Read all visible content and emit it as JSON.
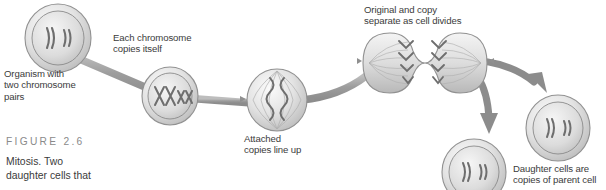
{
  "figure": {
    "label": "FIGURE 2.6",
    "caption_line1": "Mitosis. Two",
    "caption_line2": "daughter cells that",
    "label_color": "#8a8a8a",
    "text_color": "#3b3b3b",
    "background": "#ffffff"
  },
  "palette": {
    "cell_fill_light": "#f2f2f2",
    "cell_fill_mid": "#d2d2d2",
    "cell_outline": "#8f8f8f",
    "connector": "#a0a0a0",
    "arrow": "#8c8c8c",
    "chromosome": "#6e6e6e"
  },
  "stages": [
    {
      "id": "parent-cell",
      "name": "parent-cell",
      "label_lines": [
        "Organism with",
        "two chromosome",
        "pairs"
      ],
      "chromosome_glyph": "))  ))",
      "chromosome_count": 4,
      "description": "Organism with two chromosome pairs"
    },
    {
      "id": "copied-cell",
      "name": "copied-chromosome-cell",
      "label_lines": [
        "Each chromosome",
        "copies itself"
      ],
      "chromosome_glyph": "XX xx",
      "chromosome_count": 4,
      "description": "Each chromosome copies itself"
    },
    {
      "id": "aligned-cell",
      "name": "aligned-copies-cell",
      "label_lines": [
        "Attached",
        "copies line up"
      ],
      "chromosome_glyph": "X X",
      "chromosome_count": 2,
      "description": "Attached copies line up"
    },
    {
      "id": "dividing-cell",
      "name": "dividing-cell",
      "label_lines": [
        "Original and copy",
        "separate as cell divides"
      ],
      "chromosome_glyph": "VVV",
      "chromosome_count": 4,
      "description": "Original and copy separate as cell divides"
    },
    {
      "id": "daughter-cells",
      "name": "daughter-cells",
      "label_lines": [
        "Daughter cells are",
        "copies of parent cell"
      ],
      "chromosome_glyph": "))  ))",
      "chromosome_count": 4,
      "description": "Daughter cells are copies of parent cell"
    }
  ],
  "labels": {
    "parent": "Organism with\ntwo chromosome\npairs",
    "copies": "Each chromosome\ncopies itself",
    "aligned": "Attached\ncopies line up",
    "dividing": "Original and copy\nseparate as cell divides",
    "daughters": "Daughter cells are\ncopies of parent cell"
  }
}
